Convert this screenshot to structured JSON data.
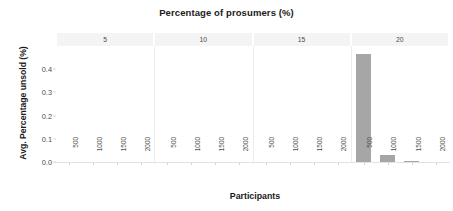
{
  "chart_data": {
    "type": "bar",
    "title": "Percentage of prosumers (%)",
    "xlabel": "Participants",
    "ylabel": "Avg. Percentage unsold (%)",
    "facet_variable": "Percentage of prosumers (%)",
    "facets": [
      "5",
      "10",
      "15",
      "20"
    ],
    "categories": [
      "500",
      "1000",
      "1500",
      "2000"
    ],
    "ylim": [
      0.0,
      0.5
    ],
    "yticks": [
      "0.0",
      "0.1",
      "0.2",
      "0.3",
      "0.4"
    ],
    "ytick_values": [
      0.0,
      0.1,
      0.2,
      0.3,
      0.4
    ],
    "grid": false,
    "legend": "none",
    "bar_color": "#a6a6a6",
    "strip_background": "#f4f4f4",
    "series": [
      {
        "name": "5",
        "values": [
          0.0,
          0.0,
          0.0,
          0.0
        ]
      },
      {
        "name": "10",
        "values": [
          0.0,
          0.0,
          0.0,
          0.0
        ]
      },
      {
        "name": "15",
        "values": [
          0.0,
          0.0,
          0.0,
          0.0
        ]
      },
      {
        "name": "20",
        "values": [
          0.47,
          0.035,
          0.008,
          0.0
        ]
      }
    ]
  },
  "axes": {
    "ytick_0": "0.0",
    "ytick_1": "0.1",
    "ytick_2": "0.2",
    "ytick_3": "0.3",
    "ytick_4": "0.4"
  },
  "facet_labels": {
    "f0": "5",
    "f1": "10",
    "f2": "15",
    "f3": "20"
  },
  "xtick_labels": {
    "t0": "500",
    "t1": "1000",
    "t2": "1500",
    "t3": "2000"
  }
}
